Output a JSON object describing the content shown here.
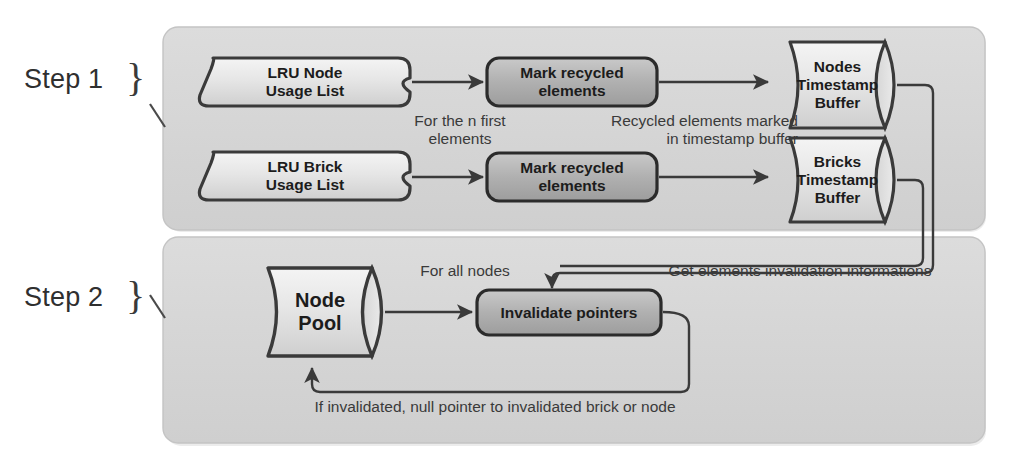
{
  "diagram": {
    "colors": {
      "page_background": "#ffffff",
      "panel_fill": "#d6d6d6",
      "panel_border": "#c2c2c2",
      "node_light_fill": "#e9e9e9",
      "node_dark_fill": "#b4b4b4",
      "node_stroke": "#3a3a3a",
      "edge_stroke": "#3a3a3a",
      "text": "#1c1c1c",
      "label_text": "#3a3a3a"
    }
  },
  "steps": [
    {
      "id": "step-1",
      "label": "Step 1",
      "bracket_glyph": "}"
    },
    {
      "id": "step-2",
      "label": "Step 2",
      "bracket_glyph": "}"
    }
  ],
  "nodes": {
    "lru_node_usage_list": {
      "shape": "data-flag",
      "lines": [
        "LRU Node",
        "Usage List"
      ],
      "fill": "light"
    },
    "lru_brick_usage_list": {
      "shape": "data-flag",
      "lines": [
        "LRU Brick",
        "Usage List"
      ],
      "fill": "light"
    },
    "mark_recycled_nodes": {
      "shape": "rounded-rect",
      "lines": [
        "Mark recycled",
        "elements"
      ],
      "fill": "dark"
    },
    "mark_recycled_bricks": {
      "shape": "rounded-rect",
      "lines": [
        "Mark recycled",
        "elements"
      ],
      "fill": "dark"
    },
    "nodes_timestamp_buffer": {
      "shape": "cylinder",
      "lines": [
        "Nodes",
        "Timestamp",
        "Buffer"
      ],
      "fill": "light"
    },
    "bricks_timestamp_buffer": {
      "shape": "cylinder",
      "lines": [
        "Bricks",
        "Timestamp",
        "Buffer"
      ],
      "fill": "light"
    },
    "node_pool": {
      "shape": "cylinder",
      "lines": [
        "Node",
        "Pool"
      ],
      "fill": "light"
    },
    "invalidate_pointers": {
      "shape": "rounded-rect",
      "lines": [
        "Invalidate pointers"
      ],
      "fill": "dark"
    }
  },
  "edge_labels": {
    "for_the_n_first_elements": "For the n first\nelements",
    "recycled_elements_marked": "Recycled elements marked\nin timestamp buffer",
    "for_all_nodes": "For all nodes",
    "get_elements_invalidation": "Get elements invalidation informations",
    "if_invalidated_null_pointer": "If invalidated, null pointer to invalidated brick or node"
  }
}
